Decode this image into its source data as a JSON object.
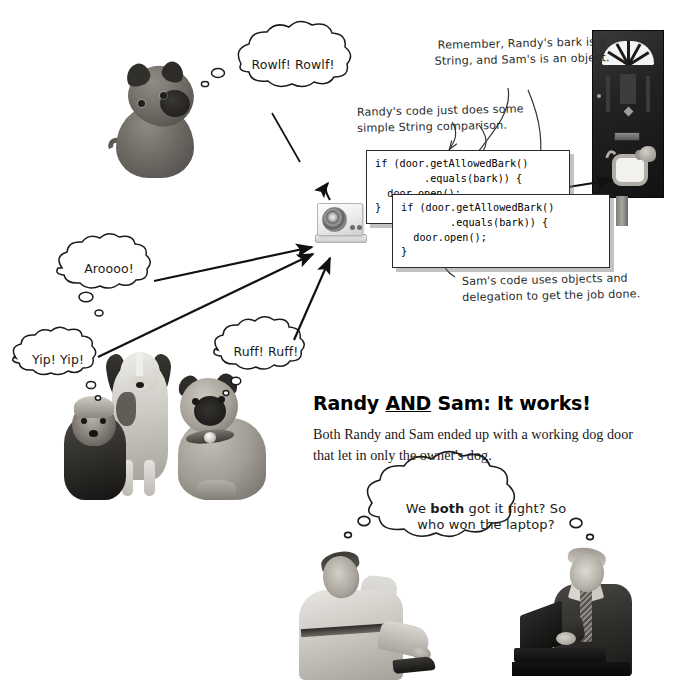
{
  "page": {
    "background_color": "#ffffff",
    "width": 687,
    "height": 691
  },
  "bubbles": [
    {
      "id": "rowlf",
      "text": "Rowlf! Rowlf!",
      "speaker": "pug-top",
      "kind": "thought"
    },
    {
      "id": "aroooo",
      "text": "Aroooo!",
      "speaker": "off-left-dog",
      "kind": "thought"
    },
    {
      "id": "yip",
      "text": "Yip! Yip!",
      "speaker": "yorkie",
      "kind": "thought"
    },
    {
      "id": "ruff",
      "text": "Ruff! Ruff!",
      "speaker": "pug-front",
      "kind": "thought"
    }
  ],
  "laptop_bubble": {
    "line1_before": "We ",
    "line1_bold": "both",
    "line1_after": " got it right? So",
    "line2": "who won the laptop?",
    "full_text": "We both got it right? So who won the laptop?"
  },
  "annotations": [
    {
      "id": "remember-note",
      "line1": "Remember, Randy's bark is a",
      "line2": "String, and Sam's is an object."
    },
    {
      "id": "randy-note",
      "line1": "Randy's code just does some",
      "line2": "simple String comparison."
    },
    {
      "id": "sam-note",
      "line1": "Sam's code uses objects and",
      "line2": "delegation to get the job done."
    }
  ],
  "code_boxes": [
    {
      "id": "randy-code",
      "owner": "Randy",
      "lines": [
        "if (door.getAllowedBark()",
        "        .equals(bark)) {",
        "  door.open();",
        "}"
      ]
    },
    {
      "id": "sam-code",
      "owner": "Sam",
      "lines": [
        "if (door.getAllowedBark()",
        "        .equals(bark)) {",
        "  door.open();",
        "}"
      ]
    }
  ],
  "headline": {
    "before": "Randy ",
    "underlined": "AND",
    "after": " Sam: It works!",
    "full": "Randy AND Sam: It works!"
  },
  "body_paragraph": {
    "text": "Both Randy and Sam ended up with a working dog door that let in only the owner's dog."
  },
  "figures": {
    "pug_top": "pug-dog-photo",
    "dog_trio": "three-dogs-photo",
    "speaker_device": "bark-recognizer-speaker-photo",
    "front_door": "front-door-with-dog-door-photo",
    "man_left": "randy-in-chair-photo",
    "man_right": "sam-at-laptop-photo"
  },
  "colors": {
    "ink": "#1a1a1a",
    "code_border": "#2b2b2b",
    "code_shadow": "rgba(120,120,120,0.45)",
    "paper": "#ffffff"
  }
}
